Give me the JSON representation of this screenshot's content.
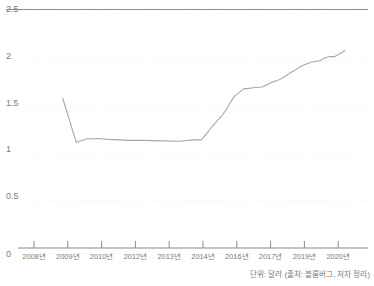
{
  "chart_data": {
    "type": "line",
    "title": "",
    "xlabel": "",
    "ylabel": "",
    "unit_note": "단위: 달러 (출처: 블룸버그, 저자 정리)",
    "ylim": [
      0,
      2.5
    ],
    "yticks": [
      "0",
      "0.5",
      "1",
      "1.5",
      "2",
      "2.5"
    ],
    "ytick_values": [
      0,
      0.5,
      1,
      1.5,
      2,
      2.5
    ],
    "grid": true,
    "legend": "none",
    "line_color": "#a9a9a9",
    "categories": [
      "2008년",
      "2009년",
      "2010년",
      "2012년",
      "2013년",
      "2014년",
      "2016년",
      "2017년",
      "2019년",
      "2020년"
    ],
    "xtick_labels": [
      "2008년",
      "2009년",
      "2010년",
      "2012년",
      "2013년",
      "2014년",
      "2016년",
      "2017년",
      "2019년",
      "2020년"
    ],
    "series": [
      {
        "name": "달러 가치",
        "points": [
          [
            2008.85,
            1.6
          ],
          [
            2009.25,
            1.13
          ],
          [
            2009.55,
            1.165
          ],
          [
            2009.9,
            1.17
          ],
          [
            2010.4,
            1.16
          ],
          [
            2011.0,
            1.155
          ],
          [
            2011.6,
            1.15
          ],
          [
            2012.2,
            1.15
          ],
          [
            2012.8,
            1.145
          ],
          [
            2013.3,
            1.14
          ],
          [
            2013.7,
            1.155
          ],
          [
            2013.95,
            1.155
          ],
          [
            2014.2,
            1.22
          ],
          [
            2014.5,
            1.29
          ],
          [
            2014.8,
            1.35
          ],
          [
            2015.1,
            1.41
          ],
          [
            2015.35,
            1.47
          ],
          [
            2015.6,
            1.55
          ],
          [
            2015.85,
            1.62
          ],
          [
            2016.05,
            1.655
          ],
          [
            2016.2,
            1.7
          ],
          [
            2016.35,
            1.705
          ],
          [
            2016.55,
            1.715
          ],
          [
            2016.75,
            1.72
          ],
          [
            2016.95,
            1.755
          ],
          [
            2017.15,
            1.775
          ],
          [
            2017.4,
            1.79
          ],
          [
            2017.7,
            1.815
          ],
          [
            2017.95,
            1.845
          ],
          [
            2018.2,
            1.875
          ],
          [
            2018.45,
            1.9
          ],
          [
            2018.7,
            1.93
          ],
          [
            2018.95,
            1.955
          ],
          [
            2019.2,
            1.985
          ],
          [
            2019.45,
            2.0
          ],
          [
            2019.6,
            2.03
          ],
          [
            2019.75,
            2.045
          ],
          [
            2019.9,
            2.045
          ],
          [
            2020.05,
            2.075
          ],
          [
            2020.2,
            2.11
          ]
        ]
      }
    ]
  }
}
